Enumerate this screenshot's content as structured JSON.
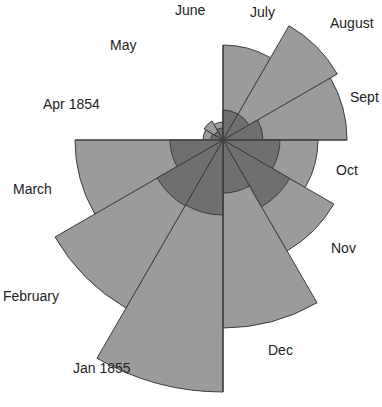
{
  "chart_data": {
    "type": "polar-area",
    "title": "",
    "center": [
      223,
      140
    ],
    "start_month": "Apr 1854",
    "direction": "clockwise",
    "colors": {
      "outer": "#9b9b9b",
      "inner": "#6f6f6f",
      "stroke": "#3c3c3c"
    },
    "categories": [
      "Apr 1854",
      "May",
      "June",
      "July",
      "August",
      "Sept",
      "Oct",
      "Nov",
      "Dec",
      "Jan 1855",
      "February",
      "March"
    ],
    "series": [
      {
        "name": "outer",
        "values": [
          20,
          22,
          18,
          95,
          132,
          124,
          95,
          128,
          188,
          252,
          194,
          148
        ]
      },
      {
        "name": "inner",
        "values": [
          12,
          10,
          12,
          30,
          30,
          40,
          57,
          77,
          53,
          75,
          76,
          53
        ]
      }
    ],
    "start_angles_deg": [
      180,
      210,
      240,
      270,
      300,
      330,
      0,
      30,
      60,
      90,
      120,
      150
    ],
    "legend": null,
    "grid": false
  },
  "labels": [
    {
      "text": "Apr 1854",
      "x": 43,
      "y": 96
    },
    {
      "text": "May",
      "x": 110,
      "y": 37
    },
    {
      "text": "June",
      "x": 175,
      "y": 2
    },
    {
      "text": "July",
      "x": 250,
      "y": 4
    },
    {
      "text": "August",
      "x": 330,
      "y": 15
    },
    {
      "text": "Sept",
      "x": 350,
      "y": 89
    },
    {
      "text": "Oct",
      "x": 336,
      "y": 162
    },
    {
      "text": "Nov",
      "x": 331,
      "y": 240
    },
    {
      "text": "Dec",
      "x": 268,
      "y": 342
    },
    {
      "text": "Jan 1855",
      "x": 73,
      "y": 360
    },
    {
      "text": "February",
      "x": 3,
      "y": 288
    },
    {
      "text": "March",
      "x": 13,
      "y": 181
    }
  ]
}
